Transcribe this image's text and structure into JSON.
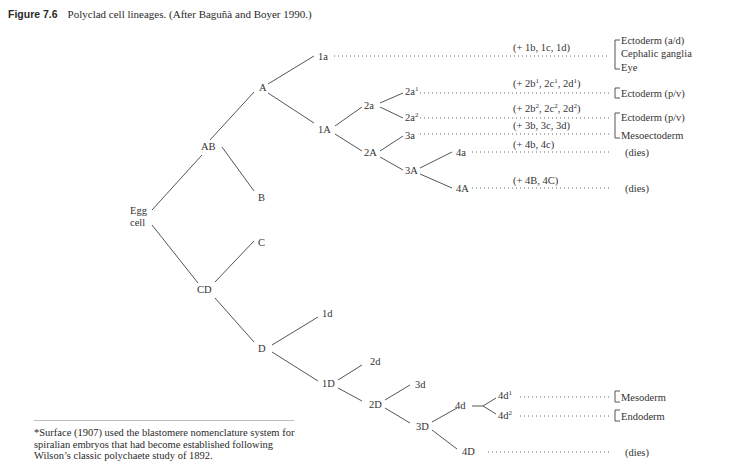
{
  "figure": {
    "label": "Figure 7.6",
    "caption": "Polyclad cell lineages. (After Baguñà and Boyer 1990.)"
  },
  "nodes": {
    "egg": [
      "Egg",
      "cell"
    ],
    "AB": "AB",
    "CD": "CD",
    "A": "A",
    "B": "B",
    "C": "C",
    "D": "D",
    "1a": "1a",
    "1A": "1A",
    "2a": "2a",
    "2A": "2A",
    "2a1": "2a",
    "2a1_sup": "1",
    "2a2": "2a",
    "2a2_sup": "2",
    "3a": "3a",
    "3A": "3A",
    "4a": "4a",
    "4A": "4A",
    "1d": "1d",
    "1D": "1D",
    "2d": "2d",
    "2D": "2D",
    "3d": "3d",
    "3D": "3D",
    "4d": "4d",
    "4D": "4D",
    "4d1": "4d",
    "4d1_sup": "1",
    "4d2": "4d",
    "4d2_sup": "2"
  },
  "equivalents": {
    "1a": "(+ 1b, 1c, 1d)",
    "2a1": [
      "(+ 2b",
      "1",
      ", 2c",
      "1",
      ", 2d",
      "1",
      ")"
    ],
    "2a2": [
      "(+ 2b",
      "2",
      ", 2c",
      "2",
      ", 2d",
      "2",
      ")"
    ],
    "3a": "(+ 3b, 3c, 3d)",
    "4a": "(+ 4b, 4c)",
    "4A": "(+ 4B, 4C)"
  },
  "fates": {
    "1a": [
      "Ectoderm (a/d)",
      "Cephalic ganglia",
      "Eye"
    ],
    "2a1": "Ectoderm (p/v)",
    "2a2": "Ectoderm (p/v)",
    "3a": "Mesoectoderm",
    "4a": "(dies)",
    "4A": "(dies)",
    "4d1": "Mesoderm",
    "4d2": "Endoderm",
    "4D": "(dies)"
  },
  "footnote": "*Surface (1907) used the blastomere nomenclature system for spiralian embryos that had become established following Wilson’s classic polychaete study of 1892."
}
